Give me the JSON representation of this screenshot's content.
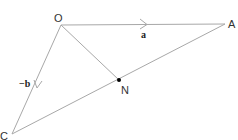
{
  "diagram": {
    "points": {
      "O": {
        "label": "O",
        "x": 61,
        "y": 25
      },
      "A": {
        "label": "A",
        "x": 225,
        "y": 24
      },
      "C": {
        "label": "C",
        "x": 12,
        "y": 134
      },
      "N": {
        "label": "N",
        "x": 119,
        "y": 80
      }
    },
    "vectors": {
      "OA": {
        "label": "a"
      },
      "OC": {
        "label": "−b"
      }
    },
    "colors": {
      "line": "#a0a0a0",
      "text": "#333333",
      "dot": "#000000"
    }
  }
}
